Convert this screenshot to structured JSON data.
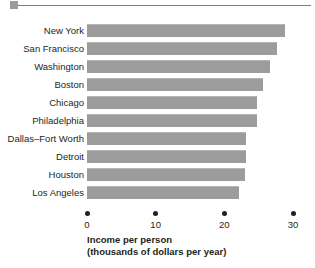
{
  "ornament": {
    "square_color": "#9b9b9b",
    "rule_color": "#7d7d7d"
  },
  "chart_data": {
    "type": "bar",
    "orientation": "horizontal",
    "title": "",
    "xlabel_line1": "Income per person",
    "xlabel_line2": "(thousands of dollars per year)",
    "ylabel": "",
    "xlim": [
      0,
      30
    ],
    "xticks": [
      0,
      10,
      20,
      30
    ],
    "xtick_labels": [
      "0",
      "10",
      "20",
      "30"
    ],
    "grid": false,
    "legend": null,
    "bar_color": "#9c9c9c",
    "categories": [
      "New York",
      "San Francisco",
      "Washington",
      "Boston",
      "Chicago",
      "Philadelphia",
      "Dallas–Fort Worth",
      "Detroit",
      "Houston",
      "Los Angeles"
    ],
    "values": [
      28.8,
      27.7,
      26.7,
      25.6,
      24.7,
      24.7,
      23.2,
      23.1,
      23.0,
      22.1
    ]
  }
}
